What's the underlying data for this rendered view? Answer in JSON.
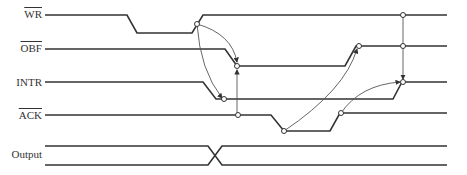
{
  "diagram": {
    "type": "timing-diagram",
    "signals": [
      {
        "id": "wr",
        "label": "WR",
        "active_low": true
      },
      {
        "id": "obf",
        "label": "OBF",
        "active_low": true
      },
      {
        "id": "intr",
        "label": "INTR",
        "active_low": false
      },
      {
        "id": "ack",
        "label": "ACK",
        "active_low": true
      },
      {
        "id": "output",
        "label": "Output",
        "active_low": false
      }
    ],
    "colors": {
      "line": "#333333",
      "arrow": "#555555",
      "background": "#ffffff"
    }
  }
}
